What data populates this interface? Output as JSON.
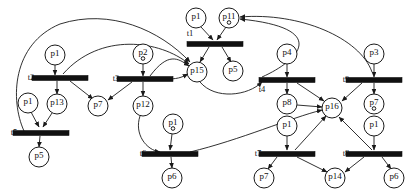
{
  "diagram": {
    "type": "petri-net",
    "title": "",
    "background_color": "#ffffff",
    "stroke_color": "#1a1a1a",
    "transition_fill": "#111111",
    "place_fill": "#ffffff",
    "place_radius": 10,
    "transition_width": 56,
    "transition_height": 5,
    "places": [
      {
        "id": "P_p1_a",
        "label": "p1",
        "x": 55,
        "y": 55,
        "tokens": 0
      },
      {
        "id": "P_p1_b",
        "label": "p1",
        "x": 28,
        "y": 103,
        "tokens": 0
      },
      {
        "id": "P_p13",
        "label": "p13",
        "x": 57,
        "y": 104,
        "tokens": 0
      },
      {
        "id": "P_p7_a",
        "label": "p7",
        "x": 98,
        "y": 106,
        "tokens": 0
      },
      {
        "id": "P_p5_a",
        "label": "p5",
        "x": 39,
        "y": 157,
        "tokens": 0
      },
      {
        "id": "P_p2",
        "label": "p2",
        "x": 143,
        "y": 54,
        "tokens": 1
      },
      {
        "id": "P_p12",
        "label": "p12",
        "x": 143,
        "y": 106,
        "tokens": 0
      },
      {
        "id": "P_p1_c",
        "label": "p1",
        "x": 173,
        "y": 124,
        "tokens": 1
      },
      {
        "id": "P_p6_a",
        "label": "p6",
        "x": 172,
        "y": 178,
        "tokens": 0
      },
      {
        "id": "P_p1_d",
        "label": "p1",
        "x": 196,
        "y": 18,
        "tokens": 0
      },
      {
        "id": "P_p11",
        "label": "p11",
        "x": 229,
        "y": 18,
        "tokens": 1
      },
      {
        "id": "P_p15",
        "label": "p15",
        "x": 197,
        "y": 72,
        "tokens": 0
      },
      {
        "id": "P_p5_b",
        "label": "p5",
        "x": 233,
        "y": 71,
        "tokens": 0
      },
      {
        "id": "P_p4",
        "label": "p4",
        "x": 287,
        "y": 54,
        "tokens": 0
      },
      {
        "id": "P_p8",
        "label": "p8",
        "x": 287,
        "y": 104,
        "tokens": 0
      },
      {
        "id": "P_p1_e",
        "label": "p1",
        "x": 287,
        "y": 126,
        "tokens": 0
      },
      {
        "id": "P_p7_b",
        "label": "p7",
        "x": 264,
        "y": 178,
        "tokens": 0
      },
      {
        "id": "P_p14",
        "label": "p14",
        "x": 335,
        "y": 178,
        "tokens": 0
      },
      {
        "id": "P_p16",
        "label": "p16",
        "x": 332,
        "y": 108,
        "tokens": 0
      },
      {
        "id": "P_p3",
        "label": "p3",
        "x": 374,
        "y": 54,
        "tokens": 0
      },
      {
        "id": "P_p7_c",
        "label": "p7",
        "x": 374,
        "y": 104,
        "tokens": 1
      },
      {
        "id": "P_p1_f",
        "label": "p1",
        "x": 374,
        "y": 126,
        "tokens": 0
      },
      {
        "id": "P_p6_b",
        "label": "p6",
        "x": 394,
        "y": 178,
        "tokens": 0
      }
    ],
    "transitions": [
      {
        "id": "T_t1",
        "label": "t1",
        "x": 215,
        "y": 44,
        "label_x": 190,
        "label_y": 34
      },
      {
        "id": "T_t2",
        "label": "t2",
        "x": 60,
        "y": 78,
        "label_x": 31,
        "label_y": 78
      },
      {
        "id": "T_t3",
        "label": "t3",
        "x": 145,
        "y": 79,
        "label_x": 116,
        "label_y": 79
      },
      {
        "id": "T_t4",
        "label": "t4",
        "x": 287,
        "y": 80,
        "label_x": 262,
        "label_y": 90
      },
      {
        "id": "T_t5",
        "label": "t5",
        "x": 41,
        "y": 133,
        "label_x": 14,
        "label_y": 133
      },
      {
        "id": "T_t6",
        "label": "t6",
        "x": 170,
        "y": 154,
        "label_x": 143,
        "label_y": 154
      },
      {
        "id": "T_t7",
        "label": "t7",
        "x": 287,
        "y": 154,
        "label_x": 258,
        "label_y": 154
      },
      {
        "id": "T_t8",
        "label": "t8",
        "x": 374,
        "y": 154,
        "label_x": 346,
        "label_y": 154
      },
      {
        "id": "T_t9",
        "label": "t9",
        "x": 374,
        "y": 80,
        "label_x": 346,
        "label_y": 80
      }
    ],
    "arcs": [
      {
        "from": "P_p1_a",
        "to": "T_t2",
        "path": "M 55,65 L 55,75"
      },
      {
        "from": "T_t2",
        "to": "P_p13",
        "path": "M 57,81 L 57,94"
      },
      {
        "from": "T_t2",
        "to": "P_p7_a",
        "path": "M 70,81 L 93,99"
      },
      {
        "from": "P_p1_b",
        "to": "T_t5",
        "path": "M 31,112 L 39,127"
      },
      {
        "from": "P_p13",
        "to": "T_t5",
        "path": "M 52,113 L 43,127"
      },
      {
        "from": "T_t5",
        "to": "P_p5_a",
        "path": "M 40,136 L 39,147"
      },
      {
        "from": "P_p2",
        "to": "T_t3",
        "path": "M 143,64 L 143,76"
      },
      {
        "from": "T_t3",
        "to": "P_p12",
        "path": "M 143,82 L 143,96"
      },
      {
        "from": "T_t3",
        "to": "P_p7_a",
        "path": "M 132,82 L 108,100"
      },
      {
        "from": "P_p12",
        "to": "T_t6",
        "path": "M 140,116 C 134,134 146,150 160,152"
      },
      {
        "from": "P_p1_c",
        "to": "T_t6",
        "path": "M 172,134 L 170,150"
      },
      {
        "from": "T_t6",
        "to": "P_p6_a",
        "path": "M 171,157 L 172,168"
      },
      {
        "from": "P_p1_d",
        "to": "T_t1",
        "path": "M 201,27 L 213,40"
      },
      {
        "from": "P_p11",
        "to": "T_t1",
        "path": "M 226,27 L 217,40"
      },
      {
        "from": "T_t1",
        "to": "P_p15",
        "path": "M 209,47 L 200,62"
      },
      {
        "from": "T_t1",
        "to": "P_p5_b",
        "path": "M 222,47 L 231,62"
      },
      {
        "from": "T_t2",
        "to": "P_p15",
        "path": "M 63,74 C 100,32 160,40 189,64"
      },
      {
        "from": "T_t3",
        "to": "P_p15",
        "path": "M 150,76 C 168,52 178,58 189,66"
      },
      {
        "from": "T_t3",
        "to": "P_p15",
        "path": "M 168,79 C 180,79 184,76 188,74"
      },
      {
        "from": "T_t4",
        "to": "P_p11",
        "path": "M 262,77 C 300,60 330,28 240,19"
      },
      {
        "from": "P_p15",
        "to": "T_t4",
        "path": "M 200,82 C 215,100 248,96 262,82"
      },
      {
        "from": "T_t9",
        "to": "P_p11",
        "path": "M 372,72 C 360,38 300,12 240,17"
      },
      {
        "from": "T_t5",
        "to": "TOP",
        "path": "M 24,131 C 10,100 12,44 60,24 C 110,8 160,30 190,62"
      },
      {
        "from": "P_p4",
        "to": "T_t4",
        "path": "M 287,64 L 287,77"
      },
      {
        "from": "T_t4",
        "to": "P_p8",
        "path": "M 287,83 L 287,94"
      },
      {
        "from": "T_t4",
        "to": "P_p16",
        "path": "M 297,83 L 324,101"
      },
      {
        "from": "P_p8",
        "to": "P_p16",
        "path": "M 297,105 L 322,107"
      },
      {
        "from": "P_p1_e",
        "to": "T_t7",
        "path": "M 287,136 L 287,150"
      },
      {
        "from": "T_t7",
        "to": "P_p7_b",
        "path": "M 277,157 L 268,169"
      },
      {
        "from": "T_t7",
        "to": "P_p14",
        "path": "M 297,157 L 327,172"
      },
      {
        "from": "T_t7",
        "to": "P_p16",
        "path": "M 295,150 L 326,116"
      },
      {
        "from": "P_p3",
        "to": "T_t9",
        "path": "M 374,64 L 374,77"
      },
      {
        "from": "T_t9",
        "to": "P_p7_c",
        "path": "M 374,83 L 374,94"
      },
      {
        "from": "T_t9",
        "to": "P_p16",
        "path": "M 362,83 L 342,101"
      },
      {
        "from": "P_p1_f",
        "to": "T_t8",
        "path": "M 374,136 L 374,150"
      },
      {
        "from": "T_t8",
        "to": "P_p6_b",
        "path": "M 382,157 L 391,169"
      },
      {
        "from": "T_t8",
        "to": "P_p14",
        "path": "M 364,157 L 345,172"
      },
      {
        "from": "T_t8",
        "to": "P_p16",
        "path": "M 372,150 L 339,117"
      },
      {
        "from": "T_t6",
        "to": "P_p16",
        "path": "M 190,152 C 240,140 290,118 322,110"
      }
    ]
  }
}
